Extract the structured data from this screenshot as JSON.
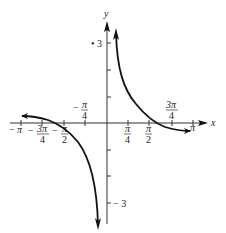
{
  "diagram": {
    "type": "function-graph",
    "axes": {
      "x_label": "x",
      "y_label": "y",
      "x_ticks": [
        {
          "label_num": "π",
          "label_sign": "−",
          "value": "-pi",
          "frac": false
        },
        {
          "label_num": "3π",
          "label_den": "4",
          "label_sign": "−",
          "value": "-3pi/4",
          "frac": true
        },
        {
          "label_num": "π",
          "label_den": "2",
          "label_sign": "−",
          "value": "-pi/2",
          "frac": true
        },
        {
          "label_num": "π",
          "label_den": "4",
          "label_sign": "−",
          "value": "-pi/4",
          "frac": true
        },
        {
          "label_num": "π",
          "label_den": "4",
          "value": "pi/4",
          "frac": true
        },
        {
          "label_num": "π",
          "label_den": "2",
          "value": "pi/2",
          "frac": true
        },
        {
          "label_num": "3π",
          "label_den": "4",
          "value": "3pi/4",
          "frac": true
        },
        {
          "label_num": "π",
          "value": "pi",
          "frac": false
        }
      ],
      "y_tick_labels": {
        "top": "3",
        "bottom": "− 3"
      }
    },
    "stray_mark": "•"
  }
}
